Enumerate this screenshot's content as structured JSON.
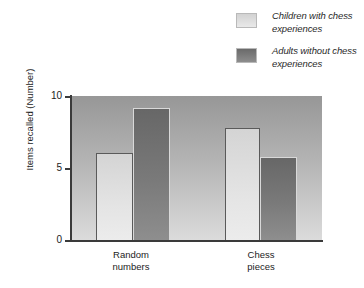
{
  "chart_data": {
    "type": "bar",
    "title": "",
    "xlabel": "",
    "ylabel": "Items recalled (Number)",
    "categories": [
      "Random numbers",
      "Chess pieces"
    ],
    "category_lines": [
      [
        "Random",
        "numbers"
      ],
      [
        "Chess",
        "pieces"
      ]
    ],
    "series": [
      {
        "name": "Children with chess experiences",
        "values": [
          6.1,
          7.8
        ],
        "color": "#e0e0e0"
      },
      {
        "name": "Adults without chess experiences",
        "values": [
          9.2,
          5.8
        ],
        "color": "#757575"
      }
    ],
    "ylim": [
      0,
      10
    ],
    "yticks": [
      0,
      5,
      10
    ],
    "ytick_labels": [
      "0",
      "5",
      "10"
    ],
    "grid": false,
    "legend_position": "top-right"
  },
  "legend": {
    "items": [
      {
        "label": "Children with chess experiences",
        "swatch": "light"
      },
      {
        "label": "Adults without chess experiences",
        "swatch": "dark"
      }
    ]
  },
  "axis": {
    "y_title": "Items recalled (Number)",
    "y_labels": [
      "10",
      "5",
      "0"
    ]
  },
  "colors": {
    "plot_bg_top": "#979797",
    "plot_bg_bottom": "#dcdcdc",
    "bar_light": "#e4e4e4",
    "bar_dark": "#7a7a7a",
    "axis": "#3a3a3a",
    "text": "#1c1c1c"
  }
}
